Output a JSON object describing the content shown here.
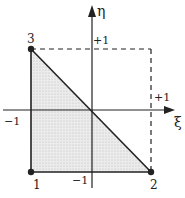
{
  "diagram": {
    "title": "",
    "axes": {
      "x_label": "ξ",
      "y_label": "η",
      "x_plus": "+1",
      "x_minus": "−1",
      "y_plus": "+1",
      "y_minus": "−1"
    },
    "nodes": [
      {
        "id": "1",
        "label": "1",
        "xi": -1,
        "eta": -1
      },
      {
        "id": "2",
        "label": "2",
        "xi": 1,
        "eta": -1
      },
      {
        "id": "3",
        "label": "3",
        "xi": -1,
        "eta": 1
      }
    ],
    "element": "triangle",
    "reference_square": "dashed",
    "colors": {
      "line": "#222222",
      "fill": "#e4e4e4",
      "background": "#ffffff"
    }
  }
}
